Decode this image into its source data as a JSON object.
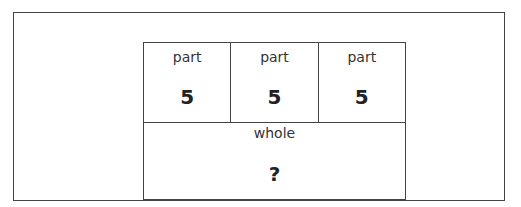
{
  "diagram": {
    "type": "bar-model",
    "parts": [
      {
        "label": "part",
        "value": "5"
      },
      {
        "label": "part",
        "value": "5"
      },
      {
        "label": "part",
        "value": "5"
      }
    ],
    "whole": {
      "label": "whole",
      "value": "?"
    }
  }
}
